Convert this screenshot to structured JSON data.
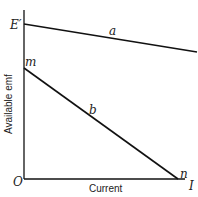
{
  "diagram": {
    "y_axis_label": "Available emf",
    "x_axis_label": "Current",
    "origin_label": "O",
    "x_end_label": "I",
    "y_top_label": "E′",
    "line_a": {
      "label": "a",
      "start_label": "E′"
    },
    "line_b": {
      "label": "b",
      "start_label": "m",
      "end_label": "n"
    },
    "colors": {
      "line": "#111111",
      "background": "#ffffff"
    }
  }
}
